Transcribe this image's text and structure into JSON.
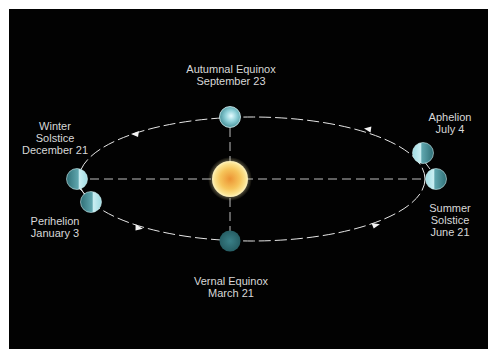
{
  "diagram": {
    "colors": {
      "background": "#020202",
      "frame": "#ffffff",
      "orbit_line": "#e6e6e6",
      "axis_line": "#bfbfbf",
      "sun_core": "#f0a030",
      "sun_edge": "#fbe7a0",
      "earth_lit": "#b9e6ea",
      "earth_dark": "#2f6f74",
      "label_text": "#d8d8d8"
    },
    "orbit": {
      "shape": "ellipse",
      "line_style": "dashed",
      "direction": "counterclockwise-as-drawn"
    },
    "sun": {
      "label": "Sun",
      "position": "center"
    },
    "points": [
      {
        "id": "autumnal-equinox",
        "name": "Autumnal Equinox",
        "date": "September 23",
        "position": "top"
      },
      {
        "id": "winter-solstice",
        "name_line1": "Winter",
        "name_line2": "Solstice",
        "date": "December 21",
        "position": "left"
      },
      {
        "id": "perihelion",
        "name": "Perihelion",
        "date": "January 3",
        "position": "lower-left"
      },
      {
        "id": "vernal-equinox",
        "name": "Vernal Equinox",
        "date": "March 21",
        "position": "bottom"
      },
      {
        "id": "summer-solstice",
        "name_line1": "Summer",
        "name_line2": "Solstice",
        "date": "June 21",
        "position": "right"
      },
      {
        "id": "aphelion",
        "name": "Aphelion",
        "date": "July 4",
        "position": "upper-right"
      }
    ]
  }
}
